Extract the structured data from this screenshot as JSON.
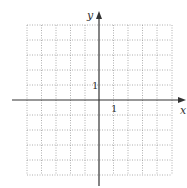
{
  "diagram": {
    "type": "coordinate-grid",
    "x_axis_label": "x",
    "y_axis_label": "y",
    "x_tick_label": "1",
    "y_tick_label": "1",
    "grid": {
      "x_min": -5,
      "x_max": 5,
      "y_min": -5,
      "y_max": 5,
      "step": 1,
      "style": "dotted"
    },
    "colors": {
      "axis": "#333333",
      "grid": "#9a9a9a"
    }
  }
}
